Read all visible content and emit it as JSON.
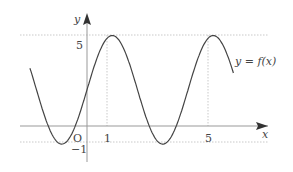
{
  "chart_data": {
    "type": "line",
    "title": "",
    "function_label": "y = f(x)",
    "xlabel": "x",
    "ylabel": "y",
    "origin_label": "O",
    "x_ticks": [
      1,
      5
    ],
    "y_ticks": [
      5,
      -1
    ],
    "tick_labels": {
      "x1": "1",
      "x5": "5",
      "y5": "5",
      "yneg1": "−1"
    },
    "formula_estimate": "f(x) = 2 + 3cos(π(x−1)/2)",
    "x_range": [
      -2.26,
      5.8
    ],
    "max": 5,
    "min": -1,
    "maxima_x": [
      1,
      5
    ],
    "minima_x": [
      -1,
      3
    ],
    "guides": {
      "horizontal": [
        5,
        -1
      ],
      "vertical": [
        1,
        5
      ]
    }
  }
}
